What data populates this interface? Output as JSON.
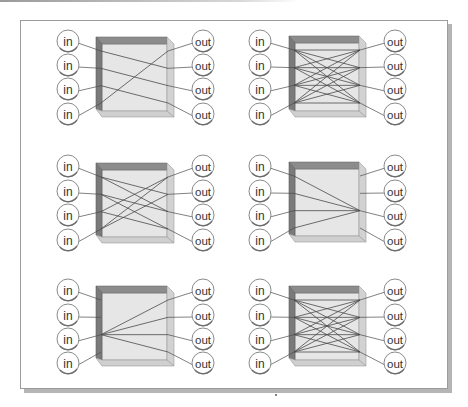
{
  "figure": {
    "colors": {
      "box_front": "#e6e6e6",
      "box_top": "#8c8c8c",
      "box_left": "#7a7a7a",
      "box_right": "#d2d2d2",
      "box_bottom": "#cfcfcf",
      "line": "#4a4a4a",
      "port_stroke": "#8a8a8a",
      "port_fill": "#ffffff"
    },
    "input_label": "in",
    "output_label": "out",
    "panels": [
      {
        "id": "panel-1",
        "name": "permutation",
        "box": {
          "x": 96,
          "y": 37,
          "w": 78,
          "h": 80
        },
        "in_x": 68,
        "out_x": 203,
        "port_y": [
          41,
          65,
          89,
          114
        ],
        "connections": [
          [
            0,
            1
          ],
          [
            1,
            2
          ],
          [
            2,
            3
          ],
          [
            3,
            0
          ]
        ]
      },
      {
        "id": "panel-2",
        "name": "full-crossbar",
        "box": {
          "x": 289,
          "y": 36,
          "w": 77,
          "h": 81
        },
        "in_x": 260,
        "out_x": 395,
        "port_y": [
          41,
          65,
          89,
          114
        ],
        "connections": [
          [
            0,
            0
          ],
          [
            0,
            1
          ],
          [
            0,
            2
          ],
          [
            0,
            3
          ],
          [
            1,
            0
          ],
          [
            1,
            1
          ],
          [
            1,
            2
          ],
          [
            1,
            3
          ],
          [
            2,
            0
          ],
          [
            2,
            1
          ],
          [
            2,
            2
          ],
          [
            2,
            3
          ],
          [
            3,
            0
          ],
          [
            3,
            1
          ],
          [
            3,
            2
          ],
          [
            3,
            3
          ]
        ]
      },
      {
        "id": "panel-3",
        "name": "partial-multicast",
        "box": {
          "x": 96,
          "y": 163,
          "w": 78,
          "h": 80
        },
        "in_x": 68,
        "out_x": 203,
        "port_y": [
          166,
          191,
          215,
          240
        ],
        "connections": [
          [
            0,
            1
          ],
          [
            0,
            2
          ],
          [
            1,
            2
          ],
          [
            1,
            3
          ],
          [
            2,
            0
          ],
          [
            2,
            3
          ],
          [
            3,
            0
          ],
          [
            3,
            1
          ]
        ]
      },
      {
        "id": "panel-4",
        "name": "many-to-one",
        "box": {
          "x": 289,
          "y": 162,
          "w": 77,
          "h": 80
        },
        "in_x": 260,
        "out_x": 395,
        "port_y": [
          166,
          191,
          215,
          240
        ],
        "connections": [
          [
            0,
            2
          ],
          [
            1,
            2
          ],
          [
            2,
            2
          ],
          [
            3,
            2
          ]
        ]
      },
      {
        "id": "panel-5",
        "name": "one-to-many",
        "box": {
          "x": 96,
          "y": 286,
          "w": 78,
          "h": 80
        },
        "in_x": 68,
        "out_x": 203,
        "port_y": [
          290,
          315,
          339,
          363
        ],
        "connections": [
          [
            2,
            0
          ],
          [
            2,
            1
          ],
          [
            2,
            2
          ],
          [
            2,
            3
          ]
        ]
      },
      {
        "id": "panel-6",
        "name": "full-crossbar",
        "box": {
          "x": 289,
          "y": 286,
          "w": 77,
          "h": 80
        },
        "in_x": 260,
        "out_x": 395,
        "port_y": [
          290,
          315,
          339,
          363
        ],
        "connections": [
          [
            0,
            0
          ],
          [
            0,
            1
          ],
          [
            0,
            2
          ],
          [
            0,
            3
          ],
          [
            1,
            0
          ],
          [
            1,
            1
          ],
          [
            1,
            2
          ],
          [
            1,
            3
          ],
          [
            2,
            0
          ],
          [
            2,
            1
          ],
          [
            2,
            2
          ],
          [
            2,
            3
          ],
          [
            3,
            0
          ],
          [
            3,
            1
          ],
          [
            3,
            2
          ],
          [
            3,
            3
          ]
        ]
      }
    ]
  }
}
